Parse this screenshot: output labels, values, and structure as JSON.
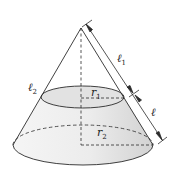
{
  "diagram": {
    "colors": {
      "stroke": "#2b2b2b",
      "fill_top": "#e6e6e6",
      "fill_body_light": "#f4f4f4",
      "fill_body_dark": "#d9d9d9",
      "background": "#ffffff"
    },
    "labels": {
      "l1": {
        "main": "ℓ",
        "sub": "1"
      },
      "l2": {
        "main": "ℓ",
        "sub": "2"
      },
      "l": {
        "main": "ℓ",
        "sub": ""
      },
      "r1": {
        "main": "r",
        "sub": "1"
      },
      "r2": {
        "main": "r",
        "sub": "2"
      }
    }
  }
}
